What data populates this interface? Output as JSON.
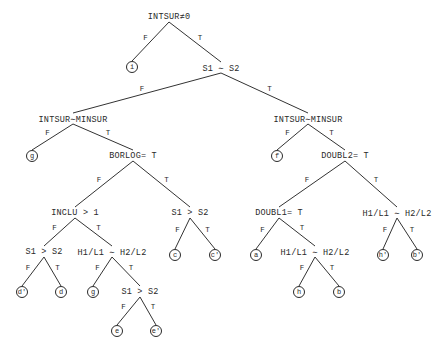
{
  "diagram": {
    "type": "decision-tree",
    "branch_labels": {
      "false": "F",
      "true": "T"
    },
    "nodes": [
      {
        "id": "n0",
        "label": "INTSUR≠0",
        "x": 169,
        "y": 17
      },
      {
        "id": "n1",
        "label": "S1 ∼ S2",
        "x": 221,
        "y": 68
      },
      {
        "id": "n2",
        "label": "INTSUR∼MINSUR",
        "x": 73,
        "y": 119
      },
      {
        "id": "n3",
        "label": "BORLOG= T",
        "x": 133,
        "y": 156
      },
      {
        "id": "n4",
        "label": "INCLU > 1",
        "x": 75,
        "y": 213
      },
      {
        "id": "n5",
        "label": "S1 > S2",
        "x": 190,
        "y": 213
      },
      {
        "id": "n6",
        "label": "S1 > S2",
        "x": 44,
        "y": 252
      },
      {
        "id": "n7",
        "label": "H1/L1 ∼ H2/L2",
        "x": 112,
        "y": 252
      },
      {
        "id": "n8",
        "label": "S1 > S2",
        "x": 140,
        "y": 292
      },
      {
        "id": "n9",
        "label": "INTSUR∼MINSUR",
        "x": 308,
        "y": 119
      },
      {
        "id": "n10",
        "label": "DOUBL2= T",
        "x": 345,
        "y": 156
      },
      {
        "id": "n11",
        "label": "DOUBL1= T",
        "x": 279,
        "y": 213
      },
      {
        "id": "n12",
        "label": "H1/L1 ∼ H2/L2",
        "x": 397,
        "y": 213
      },
      {
        "id": "n13",
        "label": "H1/L1 ∼ H2/L2",
        "x": 315,
        "y": 252
      }
    ],
    "leaves": [
      {
        "id": "l_i",
        "label": "i",
        "x": 132,
        "y": 67
      },
      {
        "id": "l_g1",
        "label": "g",
        "x": 32,
        "y": 156
      },
      {
        "id": "l_c",
        "label": "c",
        "x": 175,
        "y": 255
      },
      {
        "id": "l_c2",
        "label": "c'",
        "x": 215,
        "y": 255
      },
      {
        "id": "l_d2",
        "label": "d'",
        "x": 22,
        "y": 292
      },
      {
        "id": "l_d",
        "label": "d",
        "x": 61,
        "y": 292
      },
      {
        "id": "l_g2",
        "label": "g",
        "x": 93,
        "y": 292
      },
      {
        "id": "l_e",
        "label": "e",
        "x": 117,
        "y": 331
      },
      {
        "id": "l_e2",
        "label": "e'",
        "x": 156,
        "y": 331
      },
      {
        "id": "l_f",
        "label": "f",
        "x": 277,
        "y": 156
      },
      {
        "id": "l_a",
        "label": "a",
        "x": 256,
        "y": 255
      },
      {
        "id": "l_h",
        "label": "h",
        "x": 299,
        "y": 292
      },
      {
        "id": "l_b",
        "label": "b",
        "x": 339,
        "y": 292
      },
      {
        "id": "l_h2",
        "label": "h'",
        "x": 383,
        "y": 255
      },
      {
        "id": "l_b2",
        "label": "b'",
        "x": 417,
        "y": 255
      }
    ],
    "edges": [
      {
        "from": "n0",
        "to": "l_i",
        "label": "F"
      },
      {
        "from": "n0",
        "to": "n1",
        "label": "T"
      },
      {
        "from": "n1",
        "to": "n2",
        "label": "F"
      },
      {
        "from": "n1",
        "to": "n9",
        "label": "T"
      },
      {
        "from": "n2",
        "to": "l_g1",
        "label": "F"
      },
      {
        "from": "n2",
        "to": "n3",
        "label": "T"
      },
      {
        "from": "n3",
        "to": "n4",
        "label": "F"
      },
      {
        "from": "n3",
        "to": "n5",
        "label": "T"
      },
      {
        "from": "n4",
        "to": "n6",
        "label": "F"
      },
      {
        "from": "n4",
        "to": "n7",
        "label": "T"
      },
      {
        "from": "n5",
        "to": "l_c",
        "label": "F"
      },
      {
        "from": "n5",
        "to": "l_c2",
        "label": "T"
      },
      {
        "from": "n6",
        "to": "l_d2",
        "label": "F"
      },
      {
        "from": "n6",
        "to": "l_d",
        "label": "T"
      },
      {
        "from": "n7",
        "to": "l_g2",
        "label": "F"
      },
      {
        "from": "n7",
        "to": "n8",
        "label": "T"
      },
      {
        "from": "n8",
        "to": "l_e",
        "label": "F"
      },
      {
        "from": "n8",
        "to": "l_e2",
        "label": "T"
      },
      {
        "from": "n9",
        "to": "l_f",
        "label": "F"
      },
      {
        "from": "n9",
        "to": "n10",
        "label": "T"
      },
      {
        "from": "n10",
        "to": "n11",
        "label": "F"
      },
      {
        "from": "n10",
        "to": "n12",
        "label": "T"
      },
      {
        "from": "n11",
        "to": "l_a",
        "label": "F"
      },
      {
        "from": "n11",
        "to": "n13",
        "label": "T"
      },
      {
        "from": "n13",
        "to": "l_h",
        "label": "F"
      },
      {
        "from": "n13",
        "to": "l_b",
        "label": "T"
      },
      {
        "from": "n12",
        "to": "l_h2",
        "label": "F"
      },
      {
        "from": "n12",
        "to": "l_b2",
        "label": "T"
      }
    ]
  }
}
